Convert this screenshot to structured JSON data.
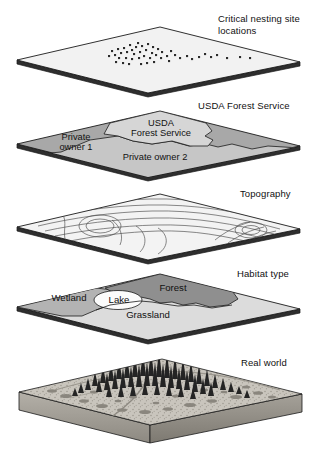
{
  "figure": {
    "type": "gis-layer-cake-diagram",
    "title": "",
    "width": 317,
    "height": 449
  },
  "labels": {
    "nesting": "Critical nesting site\nlocations",
    "ownership": "USDA Forest Service",
    "topography": "Topography",
    "habitat": "Habitat type",
    "realworld": "Real world"
  },
  "layers": [
    {
      "id": "nesting",
      "label": "Critical nesting site locations",
      "label_x": 218,
      "label_y": 13,
      "plane_cy": 60,
      "kind": "point-layer",
      "fill": "#f2f2f2",
      "features": []
    },
    {
      "id": "ownership",
      "label": "USDA Forest Service",
      "label_x": 208,
      "label_y": 100,
      "plane_cy": 144,
      "kind": "polygon-layer",
      "fill": "#a8a8a8",
      "features": [
        {
          "name": "USDA Forest Service",
          "polygon_label": "USDA\nForest Service",
          "fill": "#d0d0d0"
        },
        {
          "name": "Private owner 1",
          "polygon_label": "Private\nowner 1",
          "fill": "#a8a8a8"
        },
        {
          "name": "Private owner 2",
          "polygon_label": "Private owner 2",
          "fill": "#c2c2c2"
        }
      ]
    },
    {
      "id": "topography",
      "label": "Topography",
      "label_x": 243,
      "label_y": 188,
      "plane_cy": 227,
      "kind": "contour-layer",
      "fill": "#f2f2f2",
      "features": []
    },
    {
      "id": "habitat",
      "label": "Habitat type",
      "label_x": 238,
      "label_y": 268,
      "plane_cy": 307,
      "kind": "polygon-layer",
      "fill": "#d8d8d8",
      "features": [
        {
          "name": "Forest",
          "polygon_label": "Forest",
          "fill": "#8f8f8f"
        },
        {
          "name": "Wetland",
          "polygon_label": "Wetland",
          "fill": "#b3b3b3"
        },
        {
          "name": "Lake",
          "polygon_label": "Lake",
          "fill": "#fbfbfb"
        },
        {
          "name": "Grassland",
          "polygon_label": "Grassland",
          "fill": "#dcdcdc"
        }
      ]
    },
    {
      "id": "realworld",
      "label": "Real world",
      "label_x": 240,
      "label_y": 357,
      "plane_cy": 402,
      "kind": "terrain-block",
      "fill": "#b9b5ad",
      "features": [
        {
          "name": "conifer-forest-stand"
        },
        {
          "name": "grassland-shrub-plain"
        },
        {
          "name": "stream-channel"
        }
      ]
    }
  ],
  "polygon_labels": {
    "usda_line1": "USDA",
    "usda_line2": "Forest Service",
    "private1_line1": "Private",
    "private1_line2": "owner 1",
    "private2": "Private owner 2",
    "forest": "Forest",
    "wetland": "Wetland",
    "lake": "Lake",
    "grassland": "Grassland"
  },
  "colors": {
    "outline": "#1a1a1a",
    "slab_edge": "#3a3a3a",
    "plane_light": "#f2f2f2",
    "gray_dark": "#8f8f8f",
    "gray_mid": "#b3b3b3",
    "gray_light": "#d8d8d8",
    "white": "#ffffff",
    "text": "#111111"
  }
}
